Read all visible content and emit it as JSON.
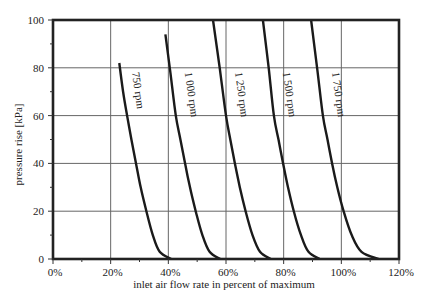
{
  "chart_data": {
    "type": "line",
    "title": "",
    "xlabel": "inlet air flow rate in percent of maximum",
    "ylabel": "pressure rise  [kPa]",
    "xlim": [
      0,
      120
    ],
    "ylim": [
      0,
      100
    ],
    "x_ticks": [
      0,
      20,
      40,
      60,
      80,
      100,
      120
    ],
    "x_tick_labels": [
      "0%",
      "20%",
      "40%",
      "60%",
      "80%",
      "100%",
      "120%"
    ],
    "y_ticks": [
      0,
      20,
      40,
      60,
      80,
      100
    ],
    "y_tick_labels": [
      "0",
      "20",
      "40",
      "60",
      "80",
      "100"
    ],
    "grid": true,
    "legend": "none (inline curve labels)",
    "series": [
      {
        "name": "750 rpm",
        "label": "750 rpm",
        "points": [
          [
            23.0,
            82
          ],
          [
            24.3,
            70
          ],
          [
            25.7,
            60
          ],
          [
            27.2,
            50
          ],
          [
            28.8,
            40
          ],
          [
            30.4,
            30
          ],
          [
            32.4,
            20
          ],
          [
            34.6,
            10
          ],
          [
            37.0,
            3
          ],
          [
            41.0,
            0
          ]
        ]
      },
      {
        "name": "1 000 rpm",
        "label": "1 000 rpm",
        "points": [
          [
            39.0,
            94
          ],
          [
            40.7,
            78
          ],
          [
            42.6,
            60
          ],
          [
            44.2,
            50
          ],
          [
            45.8,
            40
          ],
          [
            47.5,
            30
          ],
          [
            49.5,
            20
          ],
          [
            51.8,
            10
          ],
          [
            54.3,
            3
          ],
          [
            58.0,
            0
          ]
        ]
      },
      {
        "name": "1 250 rpm",
        "label": "1 250 rpm",
        "points": [
          [
            55.5,
            100
          ],
          [
            57.8,
            80
          ],
          [
            60.0,
            60
          ],
          [
            61.5,
            50
          ],
          [
            63.1,
            40
          ],
          [
            64.8,
            30
          ],
          [
            66.8,
            20
          ],
          [
            69.2,
            10
          ],
          [
            71.8,
            3
          ],
          [
            75.5,
            0
          ]
        ]
      },
      {
        "name": "1 500 rpm",
        "label": "1 500 rpm",
        "points": [
          [
            72.8,
            100
          ],
          [
            74.8,
            80
          ],
          [
            76.6,
            60
          ],
          [
            78.2,
            50
          ],
          [
            79.8,
            40
          ],
          [
            81.5,
            30
          ],
          [
            83.5,
            20
          ],
          [
            86.0,
            10
          ],
          [
            88.6,
            3
          ],
          [
            92.5,
            0
          ]
        ]
      },
      {
        "name": "1 750 rpm",
        "label": "1 750 rpm",
        "points": [
          [
            89.5,
            100
          ],
          [
            91.6,
            80
          ],
          [
            93.6,
            60
          ],
          [
            95.2,
            50
          ],
          [
            96.8,
            40
          ],
          [
            98.6,
            30
          ],
          [
            100.8,
            20
          ],
          [
            103.6,
            10
          ],
          [
            107.0,
            3
          ],
          [
            113.0,
            0
          ]
        ]
      }
    ]
  }
}
